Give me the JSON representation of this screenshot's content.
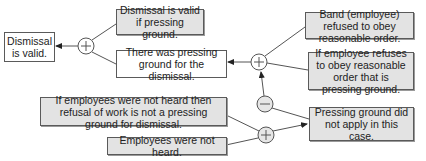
{
  "diagram": {
    "type": "argument-map",
    "nodes": {
      "conclusion": {
        "text": "Dismissal is valid.",
        "style": "white"
      },
      "premise_rule": {
        "text": "Dismissal is valid if pressing ground.",
        "style": "gray"
      },
      "intermediate": {
        "text": "There was pressing ground for the dismissal.",
        "style": "white"
      },
      "fact_refused": {
        "text": "Band (employee) refused to obey reasonable order.",
        "style": "gray"
      },
      "rule_refusal": {
        "text": "If employee refuses to obey reasonable order that is pressing ground.",
        "style": "gray"
      },
      "rebuttal": {
        "text": "Pressing ground did not apply in this case.",
        "style": "gray"
      },
      "rule_not_heard": {
        "text": "If employees were not heard then refusal of work is not a pressing ground for dismissal.",
        "style": "gray"
      },
      "fact_not_heard": {
        "text": "Employees were not heard.",
        "style": "gray"
      }
    },
    "connectors": [
      {
        "id": "plus-1",
        "symbol": "+",
        "kind": "support",
        "from": [
          "premise_rule",
          "intermediate"
        ],
        "to": "conclusion"
      },
      {
        "id": "plus-2",
        "symbol": "+",
        "kind": "support",
        "from": [
          "fact_refused",
          "rule_refusal"
        ],
        "to": "intermediate"
      },
      {
        "id": "minus-1",
        "symbol": "−",
        "kind": "attack",
        "from": [
          "rebuttal"
        ],
        "to": "plus-2"
      },
      {
        "id": "plus-3",
        "symbol": "+",
        "kind": "support",
        "from": [
          "rule_not_heard",
          "fact_not_heard"
        ],
        "to": "rebuttal"
      }
    ],
    "colors": {
      "gray_fill": "#e3e3e3",
      "white_fill": "#ffffff",
      "border": "#5a5a5a",
      "line": "#555555"
    }
  }
}
